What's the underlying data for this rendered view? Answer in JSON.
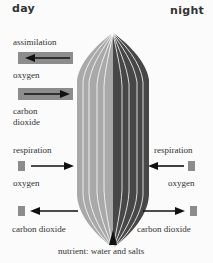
{
  "headers": {
    "day": "day",
    "night": "night"
  },
  "left": {
    "assimilation_label": "assimilation",
    "assimilation_oxygen": "oxygen",
    "assimilation_co2_line1": "carbon",
    "assimilation_co2_line2": "dioxide",
    "respiration_label": "respiration",
    "respiration_oxygen": "oxygen",
    "respiration_co2": "carbon dioxide"
  },
  "right": {
    "respiration_label": "respiration",
    "respiration_oxygen": "oxygen",
    "respiration_co2": "carbon dioxide"
  },
  "bottom": {
    "nutrient": "nutrient: water and salts"
  },
  "colors": {
    "day_half": "#a9a9a9",
    "night_half": "#474747",
    "box": "#8c8c8c",
    "arrow": "#111111",
    "vein": "#ffffff"
  }
}
